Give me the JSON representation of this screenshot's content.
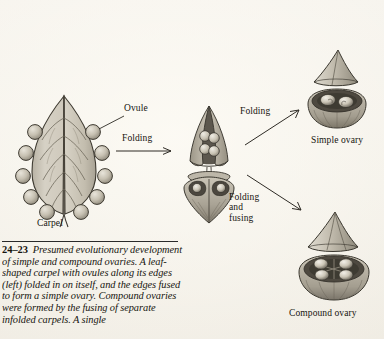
{
  "figure": {
    "number": "24–23",
    "caption": "Presumed evolutionary development of simple and compound ovaries. A leaf-shaped carpel with ovules along its edges (left) folded in on itself, and the edges fused to form a simple ovary. Compound ovaries were formed by the fusing of separate infolded carpels. A single"
  },
  "labels": {
    "ovule": "Ovule",
    "carpel": "Carpel",
    "folding_1": "Folding",
    "folding_2": "Folding",
    "folding_and_fusing": "Folding\nand\nfusing",
    "folding_and_fusing_lines": [
      "Folding",
      "and",
      "fusing"
    ],
    "simple_ovary": "Simple ovary",
    "compound_ovary": "Compound ovary"
  },
  "colors": {
    "paper": "#f3f0e9",
    "ink": "#1a1a1a",
    "line_art_stroke": "#3a372f",
    "tissue_light": "#dedacf",
    "tissue_mid": "#b9b3a5",
    "tissue_dark": "#8d8779",
    "ovule_fill": "#c9c3b4",
    "cavity_dark": "#55504a"
  },
  "diagram": {
    "type": "evolutionary-development-sequence",
    "stages": [
      {
        "id": "carpel-leaf",
        "name": "leaf-shaped carpel with marginal ovules",
        "position": "left"
      },
      {
        "id": "carpel-folding",
        "name": "partially folded carpel",
        "position": "center-top"
      },
      {
        "id": "carpel-folded",
        "name": "fully infolded carpel, cross section",
        "position": "center-bottom"
      },
      {
        "id": "simple-ovary",
        "name": "simple ovary",
        "position": "right-top"
      },
      {
        "id": "compound-ovary",
        "name": "compound ovary",
        "position": "right-bottom"
      }
    ],
    "transitions": [
      {
        "from": "carpel-leaf",
        "to": "carpel-folding",
        "label": "Folding"
      },
      {
        "from": "carpel-folding",
        "to": "simple-ovary",
        "label": "Folding"
      },
      {
        "from": "carpel-folded",
        "to": "compound-ovary",
        "label": "Folding and fusing"
      }
    ]
  }
}
